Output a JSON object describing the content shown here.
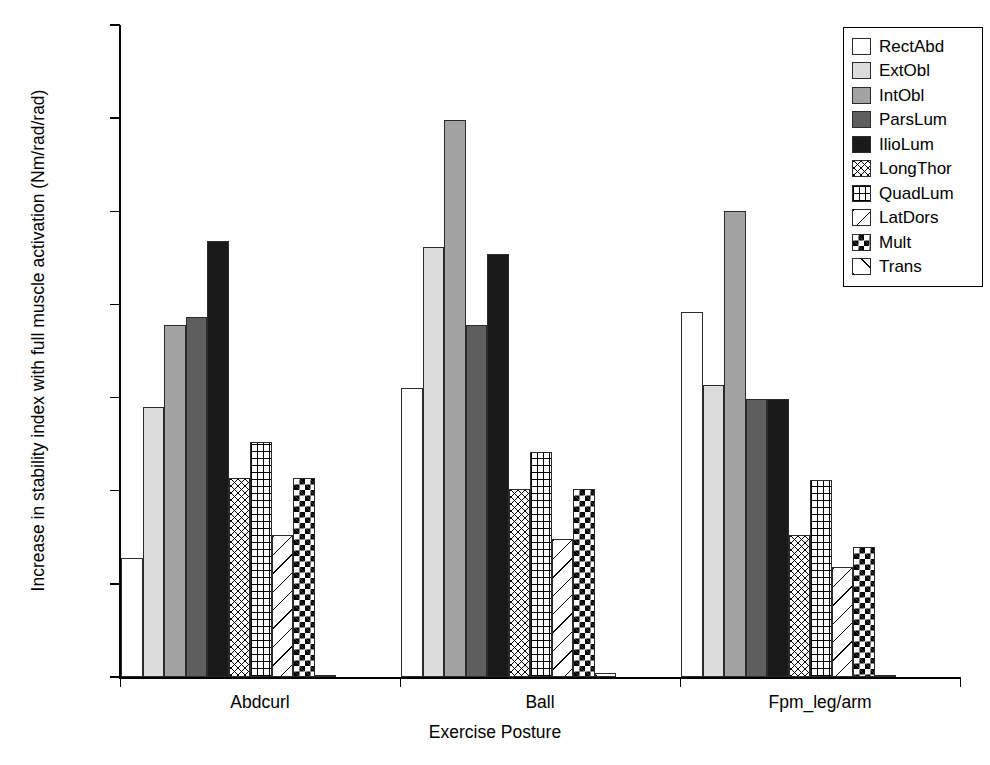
{
  "chart_data": {
    "type": "bar",
    "title": "",
    "xlabel": "Exercise Posture",
    "ylabel": "Increase in stability index with full muscle activation (Nm/rad/rad)",
    "categories": [
      "Abdcurl",
      "Ball",
      "Fpm_leg/arm"
    ],
    "ylim": [
      0,
      350
    ],
    "yticks": [
      0,
      50,
      100,
      150,
      200,
      250,
      300,
      350
    ],
    "ytick_labels": [
      "0",
      "50",
      "100",
      "150",
      "200",
      "250",
      "300",
      "350"
    ],
    "grid": false,
    "legend_position": "top-right",
    "series": [
      {
        "name": "RectAbd",
        "values": [
          64,
          155,
          196
        ],
        "fill": "solid",
        "color": "#ffffff"
      },
      {
        "name": "ExtObl",
        "values": [
          145,
          231,
          157
        ],
        "fill": "solid",
        "color": "#dcdcdc"
      },
      {
        "name": "IntObl",
        "values": [
          189,
          299,
          250
        ],
        "fill": "solid",
        "color": "#a3a3a3"
      },
      {
        "name": "ParsLum",
        "values": [
          193,
          189,
          149
        ],
        "fill": "solid",
        "color": "#5e5e5e"
      },
      {
        "name": "IlioLum",
        "values": [
          234,
          227,
          149
        ],
        "fill": "solid",
        "color": "#1a1a1a"
      },
      {
        "name": "LongThor",
        "values": [
          107,
          101,
          76
        ],
        "fill": "diag-dense",
        "color": "#ffffff"
      },
      {
        "name": "QuadLum",
        "values": [
          126,
          121,
          106
        ],
        "fill": "grid",
        "color": "#ffffff"
      },
      {
        "name": "LatDors",
        "values": [
          76,
          74,
          59
        ],
        "fill": "diag-sparse",
        "color": "#ffffff"
      },
      {
        "name": "Mult",
        "values": [
          107,
          101,
          70
        ],
        "fill": "check",
        "color": "#ffffff"
      },
      {
        "name": "Trans",
        "values": [
          1,
          2,
          1
        ],
        "fill": "diag-one",
        "color": "#ffffff"
      }
    ]
  },
  "axis": {
    "y_title": "Increase in stability index with full muscle activation (Nm/rad/rad)",
    "x_title": "Exercise Posture"
  },
  "legend": {
    "items": [
      {
        "label": "RectAbd"
      },
      {
        "label": "ExtObl"
      },
      {
        "label": "IntObl"
      },
      {
        "label": "ParsLum"
      },
      {
        "label": "IlioLum"
      },
      {
        "label": "LongThor"
      },
      {
        "label": "QuadLum"
      },
      {
        "label": "LatDors"
      },
      {
        "label": "Mult"
      },
      {
        "label": "Trans"
      }
    ]
  }
}
